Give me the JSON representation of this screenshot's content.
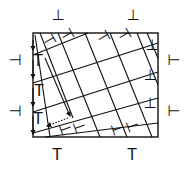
{
  "diagram": {
    "type": "dislocation-lattice",
    "frame": {
      "x": 33,
      "y": 33,
      "width": 125,
      "height": 104,
      "stroke": "#111111"
    },
    "outer_symbols": {
      "top": [
        {
          "x": 58,
          "y": 20,
          "glyph": "⊥"
        },
        {
          "x": 133,
          "y": 20,
          "glyph": "⊥"
        }
      ],
      "bottom": [
        {
          "x": 57,
          "y": 160,
          "glyph": "T"
        },
        {
          "x": 132,
          "y": 160,
          "glyph": "T"
        }
      ],
      "left": [
        {
          "x": 15,
          "y": 65,
          "glyph": "⊣"
        },
        {
          "x": 15,
          "y": 116,
          "glyph": "⊣"
        }
      ],
      "right": [
        {
          "x": 174,
          "y": 65,
          "glyph": "⊢"
        },
        {
          "x": 174,
          "y": 116,
          "glyph": "⊢"
        }
      ]
    },
    "steep_lines": [
      [
        35,
        35,
        50,
        137
      ],
      [
        40,
        33,
        73,
        118
      ],
      [
        58,
        33,
        100,
        137
      ],
      [
        85,
        33,
        127,
        137
      ],
      [
        110,
        33,
        152,
        137
      ],
      [
        137,
        33,
        158,
        85
      ],
      [
        147,
        33,
        158,
        58
      ]
    ],
    "shallow_lines": [
      [
        33,
        55,
        88,
        33
      ],
      [
        33,
        83,
        158,
        43
      ],
      [
        33,
        112,
        158,
        72
      ],
      [
        33,
        133,
        158,
        98
      ],
      [
        45,
        137,
        158,
        123
      ]
    ],
    "inner_symbols": [
      {
        "x": 50,
        "y": 45,
        "glyph": "⊣",
        "rot": -30
      },
      {
        "x": 68,
        "y": 40,
        "glyph": "⊣",
        "rot": -30
      },
      {
        "x": 104,
        "y": 42,
        "glyph": "⊣",
        "rot": -30
      },
      {
        "x": 125,
        "y": 40,
        "glyph": "⊣",
        "rot": -30
      },
      {
        "x": 152,
        "y": 50,
        "glyph": "⊥",
        "rot": 0
      },
      {
        "x": 150,
        "y": 80,
        "glyph": "⊥",
        "rot": 0
      },
      {
        "x": 150,
        "y": 108,
        "glyph": "⊥",
        "rot": 0
      },
      {
        "x": 38,
        "y": 66,
        "glyph": "T",
        "rot": 0
      },
      {
        "x": 39,
        "y": 96,
        "glyph": "T",
        "rot": 0
      },
      {
        "x": 38,
        "y": 124,
        "glyph": "T",
        "rot": 0
      },
      {
        "x": 66,
        "y": 134,
        "glyph": "⊢",
        "rot": -20
      },
      {
        "x": 80,
        "y": 132,
        "glyph": "⊢",
        "rot": -20
      },
      {
        "x": 118,
        "y": 134,
        "glyph": "⊢",
        "rot": -20
      },
      {
        "x": 133,
        "y": 131,
        "glyph": "⊢",
        "rot": -20
      }
    ],
    "arrows": [
      {
        "x1": 68,
        "y1": 118,
        "x2": 47,
        "y2": 126,
        "dashed": true
      },
      {
        "x1": 45,
        "y1": 58,
        "x2": 70,
        "y2": 116,
        "dashed": false
      }
    ]
  }
}
